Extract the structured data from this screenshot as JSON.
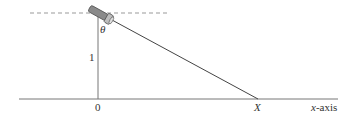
{
  "diagram": {
    "labels": {
      "theta": "θ",
      "height": "1",
      "origin": "0",
      "point": "X",
      "axis_var": "x",
      "axis_suffix": "-axis"
    },
    "elements": {
      "horizontal_reference": "dashed line",
      "source": "flashlight",
      "beam": "light ray",
      "vertical": "height line",
      "axis": "x-axis"
    },
    "colors": {
      "line": "#555555",
      "dash": "#999999",
      "flashlight_body": "#8a8a8a",
      "flashlight_head": "#bdbdbd"
    }
  }
}
